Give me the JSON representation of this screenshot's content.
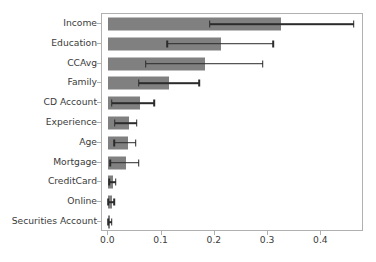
{
  "chart_data": {
    "type": "bar",
    "orientation": "horizontal",
    "title": "",
    "xlabel": "",
    "ylabel": "",
    "xlim": [
      -0.012,
      0.48
    ],
    "xticks": [
      0.0,
      0.1,
      0.2,
      0.3,
      0.4
    ],
    "xticklabels": [
      "0.0",
      "0.1",
      "0.2",
      "0.3",
      "0.4"
    ],
    "grid": false,
    "legend": null,
    "bar_color": "#808080",
    "errorbar_color": "#2b2b2b",
    "categories": [
      "Income",
      "Education",
      "CCAvg",
      "Family",
      "CD Account",
      "Experience",
      "Age",
      "Mortgage",
      "CreditCard",
      "Online",
      "Securities Account"
    ],
    "values": [
      0.324,
      0.211,
      0.181,
      0.114,
      0.059,
      0.038,
      0.036,
      0.034,
      0.008,
      0.006,
      0.002
    ],
    "error_low": [
      0.19,
      0.11,
      0.07,
      0.057,
      0.006,
      0.012,
      0.011,
      0.003,
      0.001,
      0.0,
      0.0
    ],
    "error_high": [
      0.461,
      0.309,
      0.29,
      0.171,
      0.086,
      0.053,
      0.051,
      0.057,
      0.014,
      0.011,
      0.006
    ]
  }
}
